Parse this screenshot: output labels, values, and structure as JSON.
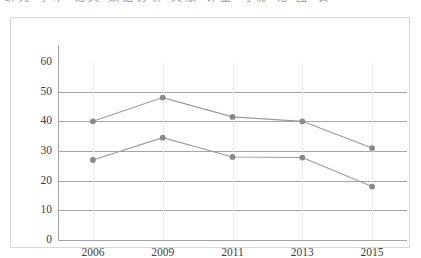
{
  "top_strip": {
    "clipped_text": "研究 学术 论文 数据分析 文献 计量 可视 化 图 表"
  },
  "colors": {
    "line": "#9b9b9b",
    "marker": "#888888",
    "gridline": "#a6a6a6",
    "gridline_vertical": "#ececec",
    "frame_border": "#d8d8d8",
    "text": "#404040",
    "background": "#ffffff"
  },
  "chart_data": {
    "type": "line",
    "title": "",
    "subtitle": "",
    "xlabel": "",
    "ylabel": "",
    "categories": [
      "2006",
      "2009",
      "2011",
      "2013",
      "2015"
    ],
    "x": [
      2006,
      2009,
      2011,
      2013,
      2015
    ],
    "series": [
      {
        "name": "series-1",
        "values": [
          40,
          48,
          41.5,
          40,
          31
        ]
      },
      {
        "name": "series-2",
        "values": [
          27,
          34.5,
          28,
          27.8,
          18
        ]
      }
    ],
    "ylim": [
      0,
      60
    ],
    "ytick_labels": [
      "0",
      "10",
      "20",
      "30",
      "40",
      "50",
      "60"
    ],
    "ytick_values": [
      0,
      10,
      20,
      30,
      40,
      50,
      60
    ],
    "xtick_labels": [
      "2006",
      "2009",
      "2011",
      "2013",
      "2015"
    ],
    "grid": {
      "horizontal": true,
      "vertical": true
    },
    "legend": {
      "visible": false,
      "position": "none"
    },
    "markers": "circle",
    "annotations": []
  }
}
